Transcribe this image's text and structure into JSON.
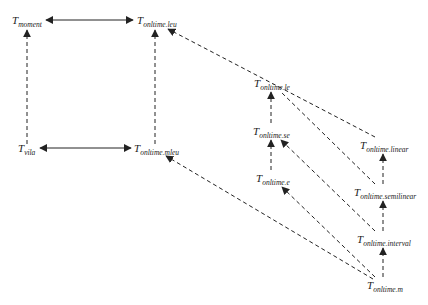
{
  "diagram": {
    "colors": {
      "line": "#222222",
      "background": "#ffffff"
    },
    "nodes": [
      {
        "id": "moment",
        "base": "T",
        "sub": "moment",
        "x": 12,
        "y": 14
      },
      {
        "id": "onltime_leu",
        "base": "T",
        "sub": "onltime.leu",
        "x": 137,
        "y": 14
      },
      {
        "id": "vila",
        "base": "T",
        "sub": "vila",
        "x": 18,
        "y": 142
      },
      {
        "id": "onltime_mleu",
        "base": "T",
        "sub": "onltime.mleu",
        "x": 134,
        "y": 142
      },
      {
        "id": "onltime_le",
        "base": "T",
        "sub": "onltime.le",
        "x": 254,
        "y": 77
      },
      {
        "id": "onltime_se",
        "base": "T",
        "sub": "onltime.se",
        "x": 253,
        "y": 125
      },
      {
        "id": "onltime_e",
        "base": "T",
        "sub": "onltime.e",
        "x": 256,
        "y": 172
      },
      {
        "id": "onltime_linear",
        "base": "T",
        "sub": "onltime.linear",
        "x": 360,
        "y": 139
      },
      {
        "id": "onltime_semilinear",
        "base": "T",
        "sub": "onltime.semilinear",
        "x": 354,
        "y": 186
      },
      {
        "id": "onltime_interval",
        "base": "T",
        "sub": "onltime.interval",
        "x": 357,
        "y": 233
      },
      {
        "id": "onltime_m",
        "base": "T",
        "sub": "onltime.m",
        "x": 367,
        "y": 279
      }
    ],
    "edges": [
      {
        "from": "moment",
        "to": "onltime_leu",
        "style": "solid",
        "direction": "both"
      },
      {
        "from": "vila",
        "to": "onltime_mleu",
        "style": "solid",
        "direction": "both"
      },
      {
        "from": "vila",
        "to": "moment",
        "style": "dashed",
        "direction": "forward"
      },
      {
        "from": "onltime_mleu",
        "to": "onltime_leu",
        "style": "dashed",
        "direction": "forward"
      },
      {
        "from": "onltime_linear",
        "to": "onltime_leu",
        "style": "dashed",
        "direction": "forward"
      },
      {
        "from": "onltime_semilinear",
        "to": "onltime_le",
        "style": "dashed",
        "direction": "forward"
      },
      {
        "from": "onltime_interval",
        "to": "onltime_se",
        "style": "dashed",
        "direction": "forward"
      },
      {
        "from": "onltime_m",
        "to": "onltime_e",
        "style": "dashed",
        "direction": "forward"
      },
      {
        "from": "onltime_m",
        "to": "onltime_mleu",
        "style": "dashed",
        "direction": "forward"
      },
      {
        "from": "onltime_se",
        "to": "onltime_le",
        "style": "dashed",
        "direction": "forward"
      },
      {
        "from": "onltime_e",
        "to": "onltime_se",
        "style": "dashed",
        "direction": "forward"
      },
      {
        "from": "onltime_semilinear",
        "to": "onltime_linear",
        "style": "dashed",
        "direction": "forward"
      },
      {
        "from": "onltime_interval",
        "to": "onltime_semilinear",
        "style": "dashed",
        "direction": "forward"
      },
      {
        "from": "onltime_m",
        "to": "onltime_interval",
        "style": "dashed",
        "direction": "forward"
      }
    ]
  }
}
